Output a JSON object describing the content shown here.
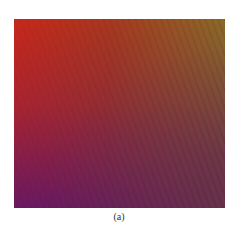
{
  "figure": {
    "caption": "(a)",
    "colors": {
      "top_left": "#c8281a",
      "top_right": "#8a6a28",
      "bottom_left": "#6e1a5a",
      "bottom_right": "#6a3a40"
    },
    "pattern": "diagonal-stripes"
  }
}
